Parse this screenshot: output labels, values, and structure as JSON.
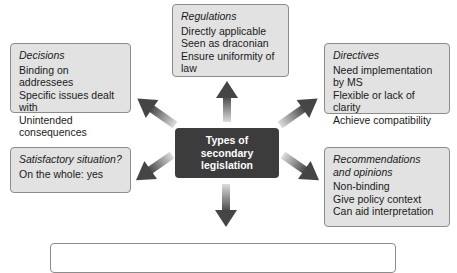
{
  "center": {
    "lines": [
      "Types of",
      "secondary",
      "legislation"
    ]
  },
  "boxes": {
    "regulations": {
      "title": "Regulations",
      "lines": [
        "Directly applicable",
        "Seen as draconian",
        "Ensure uniformity of law"
      ]
    },
    "decisions": {
      "title": "Decisions",
      "lines": [
        "Binding on addressees",
        "Specific issues dealt with",
        "Unintended consequences"
      ]
    },
    "directives": {
      "title": "Directives",
      "lines": [
        "Need implementation by MS",
        "Flexible or lack of clarity",
        "Achieve compatibility"
      ]
    },
    "satisfactory": {
      "title": "Satisfactory situation?",
      "lines": [
        "On the whole: yes"
      ]
    },
    "recommendations": {
      "title_lines": [
        "Recommendations",
        "and opinions"
      ],
      "lines": [
        "Non-binding",
        "Give policy context",
        "Can aid interpretation"
      ]
    }
  },
  "colors": {
    "box_fill": "#e2e2e2",
    "box_border": "#8c8c8c",
    "center_fill": "#3c3c3c",
    "arrow_dark": "#4a4a4a",
    "arrow_light": "#d6d6d6"
  }
}
